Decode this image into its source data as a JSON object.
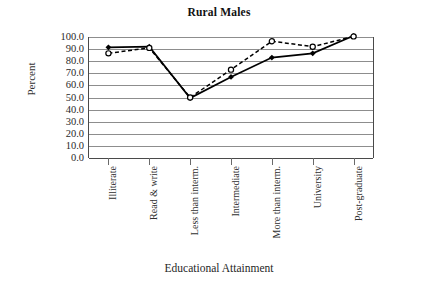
{
  "chart_data": {
    "type": "line",
    "title": "Rural Males",
    "xlabel": "Educational Attainment",
    "ylabel": "Percent",
    "categories": [
      "Illiterate",
      "Read & write",
      "Less than interm.",
      "Intermediate",
      "More than interm.",
      "University",
      "Post-graduate"
    ],
    "series": [
      {
        "name": "solid-series",
        "style": "solid",
        "marker": "filled-diamond",
        "color": "#000000",
        "values": [
          91.5,
          92.0,
          49.5,
          67.0,
          83.0,
          86.5,
          101.0
        ]
      },
      {
        "name": "dashed-series",
        "style": "dashed",
        "marker": "open-circle",
        "color": "#000000",
        "values": [
          86.5,
          91.0,
          50.0,
          73.0,
          96.5,
          92.0,
          100.5
        ]
      }
    ],
    "ylim": [
      0.0,
      100.0
    ],
    "ytick_step": 10.0,
    "ytick_labels": [
      "100.0",
      "90.0",
      "80.0",
      "70.0",
      "60.0",
      "50.0",
      "40.0",
      "30.0",
      "20.0",
      "10.0",
      "0.0"
    ],
    "grid": true,
    "legend": "none",
    "axis_color": "#4a4a4a",
    "grid_color": "#8d8d8d"
  }
}
